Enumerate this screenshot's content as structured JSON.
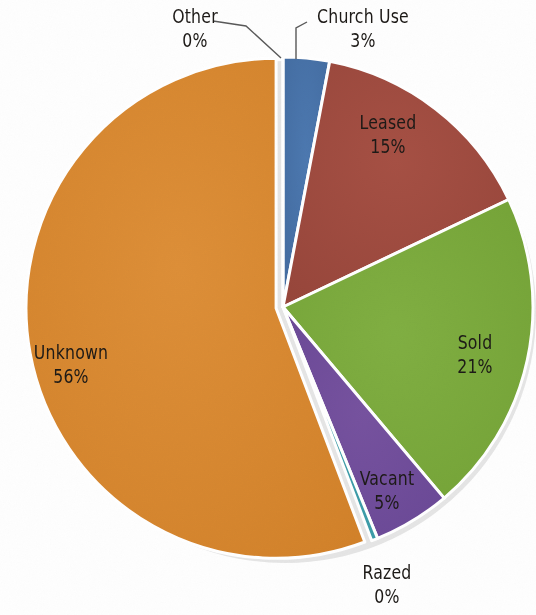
{
  "chart_data": {
    "type": "pie",
    "title": "",
    "subtitle": "",
    "xlabel": "",
    "ylabel": "",
    "legend_position": "none",
    "grid": false,
    "label_format": "name + percent",
    "categories": [
      "Church Use",
      "Leased",
      "Sold",
      "Vacant",
      "Razed",
      "Unknown",
      "Other"
    ],
    "values": [
      3,
      15,
      21,
      5,
      0,
      56,
      0
    ],
    "labels": [
      {
        "name": "Church Use",
        "percent": "3%",
        "value": 3,
        "color": "#4572a7",
        "placement": "outside-leader"
      },
      {
        "name": "Leased",
        "percent": "15%",
        "value": 15,
        "color": "#9e4b3e",
        "placement": "inside"
      },
      {
        "name": "Sold",
        "percent": "21%",
        "value": 21,
        "color": "#7aa93c",
        "placement": "inside"
      },
      {
        "name": "Vacant",
        "percent": "5%",
        "value": 5,
        "color": "#6f4c9b",
        "placement": "inside"
      },
      {
        "name": "Razed",
        "percent": "0%",
        "value": 0,
        "color": "#3d9ca8",
        "placement": "outside-below"
      },
      {
        "name": "Unknown",
        "percent": "56%",
        "value": 56,
        "color": "#d9872e",
        "placement": "inside"
      },
      {
        "name": "Other",
        "percent": "0%",
        "value": 0,
        "color": "#d9872e",
        "placement": "outside-leader"
      }
    ],
    "colors": {
      "church_use": "#4572a7",
      "leased": "#9e4b3e",
      "sold": "#7aa93c",
      "vacant": "#6f4c9b",
      "razed": "#3d9ca8",
      "unknown": "#d9872e",
      "other": "#d9872e",
      "slice_border": "#ffffff",
      "leader_line": "#595959",
      "label_text": "#1d1a17",
      "background": "#fefefe"
    }
  },
  "slices": {
    "church_use": {
      "name": "Church Use",
      "percent": "3%"
    },
    "leased": {
      "name": "Leased",
      "percent": "15%"
    },
    "sold": {
      "name": "Sold",
      "percent": "21%"
    },
    "vacant": {
      "name": "Vacant",
      "percent": "5%"
    },
    "razed": {
      "name": "Razed",
      "percent": "0%"
    },
    "unknown": {
      "name": "Unknown",
      "percent": "56%"
    },
    "other": {
      "name": "Other",
      "percent": "0%"
    }
  }
}
